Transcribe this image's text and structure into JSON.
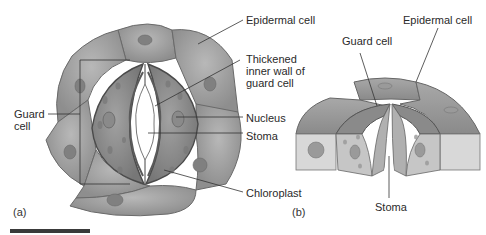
{
  "figure": {
    "panel_a": {
      "label": "(a)",
      "labels": {
        "epidermal_cell": "Epidermal cell",
        "thickened_wall": "Thickened\ninner wall of\nguard cell",
        "guard_cell": "Guard\ncell",
        "nucleus": "Nucleus",
        "stoma": "Stoma",
        "chloroplast": "Chloroplast"
      }
    },
    "panel_b": {
      "label": "(b)",
      "labels": {
        "epidermal_cell": "Epidermal cell",
        "guard_cell": "Guard cell",
        "stoma": "Stoma"
      }
    },
    "colors": {
      "epidermal": "#9c9c9c",
      "epidermal_light": "#b9b9b9",
      "guard": "#8a8a8a",
      "nucleus": "#777777",
      "outline": "#555555",
      "pore": "#ffffff",
      "leader": "#333333"
    }
  }
}
